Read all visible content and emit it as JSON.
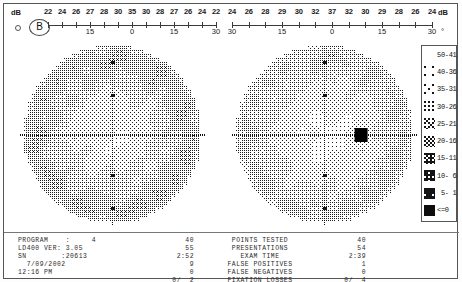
{
  "document": {
    "type": "binocular-visual-field-printout",
    "badge": "B"
  },
  "ruler_left": {
    "unit_db": "dB",
    "unit_deg": "°",
    "db_values": [
      "22",
      "24",
      "26",
      "27",
      "28",
      "30",
      "35",
      "30",
      "28",
      "27",
      "26",
      "24",
      "22"
    ],
    "degree_labels": [
      {
        "pos": 0,
        "label": ""
      },
      {
        "pos": 3,
        "label": "15"
      },
      {
        "pos": 6,
        "label": "0"
      },
      {
        "pos": 9,
        "label": "15"
      },
      {
        "pos": 12,
        "label": "30"
      }
    ]
  },
  "ruler_right": {
    "unit_db": "dB",
    "unit_deg": "°",
    "db_values": [
      "24",
      "26",
      "28",
      "29",
      "30",
      "32",
      "37",
      "32",
      "30",
      "29",
      "28",
      "26",
      "24"
    ],
    "degree_labels": [
      {
        "pos": 0,
        "label": "30"
      },
      {
        "pos": 3,
        "label": "15"
      },
      {
        "pos": 6,
        "label": "0"
      },
      {
        "pos": 9,
        "label": "15"
      },
      {
        "pos": 12,
        "label": "30"
      }
    ]
  },
  "legend": {
    "title": "grayscale-db-legend",
    "rows": [
      {
        "label": "50-41",
        "density": 0.0
      },
      {
        "label": "40-36",
        "density": 0.05
      },
      {
        "label": "35-31",
        "density": 0.11
      },
      {
        "label": "30-26",
        "density": 0.2
      },
      {
        "label": "25-21",
        "density": 0.33
      },
      {
        "label": "20-16",
        "density": 0.5
      },
      {
        "label": "15-11",
        "density": 0.66
      },
      {
        "label": "10- 6",
        "density": 0.8
      },
      {
        "label": " 5- 1",
        "density": 0.92
      },
      {
        "label": "<=0",
        "density": 1.0
      }
    ]
  },
  "data_panel": {
    "info_lines": [
      "PROGRAM    :     4",
      "LD400 VER: 3.05",
      "SN        :20613",
      "  7/09/2002",
      "12:16 PM"
    ],
    "labels": [
      "POINTS TESTED",
      "PRESENTATIONS",
      "EXAM TIME",
      "FALSE POSITIVES",
      "FALSE NEGATIVES",
      "FIXATION LOSSES"
    ],
    "left_values": [
      "40",
      "55",
      "2:52",
      "9",
      "0",
      "0/  2"
    ],
    "right_values": [
      "40",
      "54",
      "2:39",
      "1",
      "0",
      "0/  4"
    ]
  },
  "chart_data": {
    "type": "heatmap",
    "xlabel": "degrees (temporal – nasal)",
    "ylabel": "degrees (superior – inferior)",
    "legend_position": "right",
    "grid": false,
    "plots": [
      {
        "name": "left-eye-field",
        "eye": "left",
        "center_db": 35,
        "peripheral_db": 22,
        "blind_spot": null,
        "radius_deg": 30
      },
      {
        "name": "right-eye-field",
        "eye": "right",
        "center_db": 37,
        "peripheral_db": 24,
        "blind_spot": {
          "x_deg": 15,
          "y_deg": 0,
          "db": 0,
          "label": "<=0"
        },
        "radius_deg": 30
      }
    ]
  }
}
